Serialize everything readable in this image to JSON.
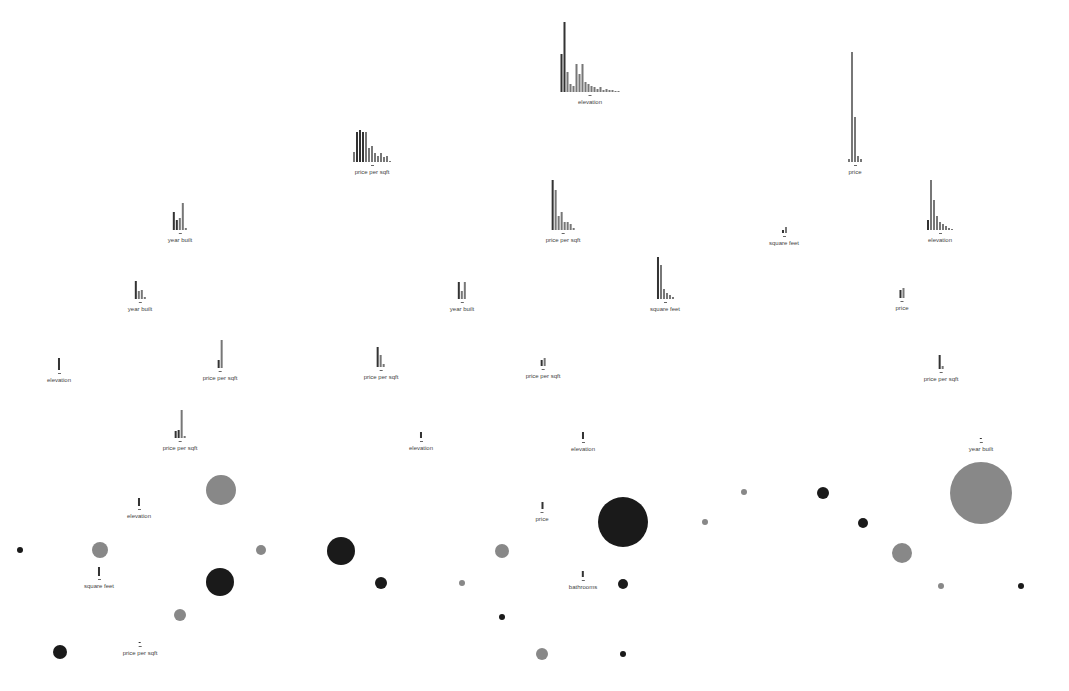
{
  "title": "",
  "nodes": [
    {
      "id": "n1",
      "label": "elevation",
      "x": 590,
      "y": 22,
      "bars": [
        38,
        70,
        20,
        8,
        6,
        28,
        18,
        28,
        10,
        8,
        6,
        5,
        3,
        5,
        2,
        3,
        2,
        2,
        1,
        1
      ],
      "dark": [
        0,
        1
      ]
    },
    {
      "id": "n2",
      "label": "price per sqft",
      "x": 372,
      "y": 130,
      "bars": [
        10,
        30,
        32,
        30,
        30,
        14,
        16,
        9,
        6,
        9,
        5,
        6,
        1
      ],
      "dark": [
        1,
        2,
        3
      ]
    },
    {
      "id": "n3",
      "label": "price",
      "x": 855,
      "y": 52,
      "bars": [
        3,
        110,
        45,
        6,
        3
      ],
      "dark": []
    },
    {
      "id": "n4",
      "label": "year built",
      "x": 180,
      "y": 203,
      "bars": [
        18,
        10,
        12,
        27,
        2
      ],
      "dark": [
        0,
        1
      ]
    },
    {
      "id": "n5",
      "label": "price per sqft",
      "x": 563,
      "y": 180,
      "bars": [
        50,
        40,
        14,
        18,
        8,
        8,
        6,
        2
      ],
      "dark": [
        0
      ]
    },
    {
      "id": "n6",
      "label": "square feet",
      "x": 784,
      "y": 227,
      "bars": [
        3,
        6
      ],
      "dark": [
        0
      ]
    },
    {
      "id": "n7",
      "label": "elevation",
      "x": 940,
      "y": 180,
      "bars": [
        10,
        50,
        30,
        14,
        8,
        6,
        4,
        2,
        1
      ],
      "dark": [
        0
      ]
    },
    {
      "id": "n8",
      "label": "year built",
      "x": 140,
      "y": 281,
      "bars": [
        18,
        8,
        9,
        2
      ],
      "dark": [
        0
      ]
    },
    {
      "id": "n9",
      "label": "year built",
      "x": 462,
      "y": 282,
      "bars": [
        17,
        8,
        17
      ],
      "dark": [
        0
      ]
    },
    {
      "id": "n10",
      "label": "square feet",
      "x": 665,
      "y": 257,
      "bars": [
        42,
        34,
        10,
        6,
        4,
        2
      ],
      "dark": [
        0
      ]
    },
    {
      "id": "n11",
      "label": "price",
      "x": 902,
      "y": 288,
      "bars": [
        8,
        10
      ],
      "dark": [
        0
      ]
    },
    {
      "id": "n12",
      "label": "elevation",
      "x": 59,
      "y": 358,
      "bars": [
        12
      ],
      "dark": [
        0
      ]
    },
    {
      "id": "n13",
      "label": "price per sqft",
      "x": 220,
      "y": 340,
      "bars": [
        8,
        28
      ],
      "dark": [
        0
      ]
    },
    {
      "id": "n14",
      "label": "price per sqft",
      "x": 381,
      "y": 347,
      "bars": [
        20,
        12,
        3
      ],
      "dark": [
        0
      ]
    },
    {
      "id": "n15",
      "label": "price per sqft",
      "x": 543,
      "y": 358,
      "bars": [
        6,
        8
      ],
      "dark": [
        0
      ]
    },
    {
      "id": "n16",
      "label": "price per sqft",
      "x": 941,
      "y": 355,
      "bars": [
        14,
        3
      ],
      "dark": [
        0
      ]
    },
    {
      "id": "n17",
      "label": "price per sqft",
      "x": 180,
      "y": 410,
      "bars": [
        7,
        8,
        28,
        2
      ],
      "dark": [
        0,
        1
      ]
    },
    {
      "id": "n18",
      "label": "elevation",
      "x": 421,
      "y": 432,
      "bars": [
        6
      ],
      "dark": [
        0
      ]
    },
    {
      "id": "n19",
      "label": "elevation",
      "x": 583,
      "y": 432,
      "bars": [
        7
      ],
      "dark": [
        0
      ]
    },
    {
      "id": "n20",
      "label": "year built",
      "x": 981,
      "y": 438,
      "bars": [
        1
      ],
      "dark": [
        0
      ]
    },
    {
      "id": "n21",
      "label": "elevation",
      "x": 139,
      "y": 498,
      "bars": [
        8
      ],
      "dark": [
        0
      ]
    },
    {
      "id": "n22",
      "label": "price",
      "x": 542,
      "y": 502,
      "bars": [
        7
      ],
      "dark": [
        0
      ]
    },
    {
      "id": "n23",
      "label": "square feet",
      "x": 99,
      "y": 567,
      "bars": [
        9
      ],
      "dark": [
        0
      ]
    },
    {
      "id": "n24",
      "label": "bathrooms",
      "x": 583,
      "y": 571,
      "bars": [
        6
      ],
      "dark": [
        0
      ]
    },
    {
      "id": "n25",
      "label": "price per sqft",
      "x": 140,
      "y": 642,
      "bars": [
        1
      ],
      "dark": [
        0
      ]
    }
  ],
  "leaves": [
    {
      "x": 221,
      "y": 490,
      "r": 15,
      "tone": "gray"
    },
    {
      "x": 20,
      "y": 550,
      "r": 3,
      "tone": "dark"
    },
    {
      "x": 100,
      "y": 550,
      "r": 8,
      "tone": "gray"
    },
    {
      "x": 261,
      "y": 550,
      "r": 5,
      "tone": "gray"
    },
    {
      "x": 220,
      "y": 582,
      "r": 14,
      "tone": "dark"
    },
    {
      "x": 180,
      "y": 615,
      "r": 6,
      "tone": "gray"
    },
    {
      "x": 60,
      "y": 652,
      "r": 7,
      "tone": "dark"
    },
    {
      "x": 341,
      "y": 551,
      "r": 14,
      "tone": "dark"
    },
    {
      "x": 381,
      "y": 583,
      "r": 6,
      "tone": "dark"
    },
    {
      "x": 462,
      "y": 583,
      "r": 3,
      "tone": "gray"
    },
    {
      "x": 502,
      "y": 551,
      "r": 7,
      "tone": "gray"
    },
    {
      "x": 502,
      "y": 617,
      "r": 3,
      "tone": "dark"
    },
    {
      "x": 623,
      "y": 522,
      "r": 25,
      "tone": "dark"
    },
    {
      "x": 623,
      "y": 584,
      "r": 5,
      "tone": "dark"
    },
    {
      "x": 542,
      "y": 654,
      "r": 6,
      "tone": "gray"
    },
    {
      "x": 623,
      "y": 654,
      "r": 3,
      "tone": "dark"
    },
    {
      "x": 744,
      "y": 492,
      "r": 3,
      "tone": "gray"
    },
    {
      "x": 705,
      "y": 522,
      "r": 3,
      "tone": "gray"
    },
    {
      "x": 823,
      "y": 493,
      "r": 6,
      "tone": "dark"
    },
    {
      "x": 863,
      "y": 523,
      "r": 5,
      "tone": "dark"
    },
    {
      "x": 902,
      "y": 553,
      "r": 10,
      "tone": "gray"
    },
    {
      "x": 941,
      "y": 586,
      "r": 3,
      "tone": "gray"
    },
    {
      "x": 1021,
      "y": 586,
      "r": 3,
      "tone": "dark"
    },
    {
      "x": 981,
      "y": 493,
      "r": 31,
      "tone": "gray"
    }
  ],
  "colors": {
    "dark": "#1a1a1a",
    "gray": "#888888",
    "bar": "#777777",
    "bar_dark": "#333333",
    "label": "#444444"
  }
}
